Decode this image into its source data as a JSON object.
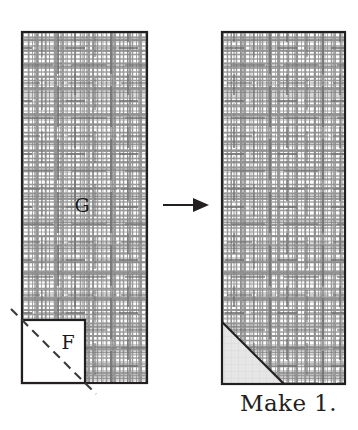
{
  "figure": {
    "type": "quilting-block-assembly-diagram",
    "caption": "Make 1.",
    "arrow": {
      "icon": "right-arrow-icon",
      "direction": "right"
    },
    "colors": {
      "outline": "#231f20",
      "fabric_print_line": "#8d8d8d",
      "fabric_print_line_dark": "#6e6e6e",
      "fabric_background": "#ffffff",
      "solid_patch_fill": "#e2e2e2",
      "text": "#231f20",
      "dashed_line": "#3a3a3a"
    },
    "before": {
      "name": "before-unit",
      "description": "Background rectangle G with square F placed on lower-left corner, marked with a diagonal sewing line",
      "pieces": [
        {
          "id": "G",
          "label": "G",
          "shape": "rectangle",
          "fabric": "printed",
          "label_x": 82,
          "label_y": 212,
          "x": 22,
          "y": 32,
          "width": 125,
          "height": 351
        },
        {
          "id": "F",
          "label": "F",
          "shape": "square",
          "fabric": "solid",
          "label_x": 68,
          "label_y": 349,
          "x": 22,
          "y": 320,
          "width": 63,
          "height": 63,
          "sewing_line": {
            "style": "dashed",
            "from_corner": "top-left",
            "to_corner": "bottom-right"
          }
        }
      ]
    },
    "after": {
      "name": "after-unit",
      "description": "Same rectangle after stitching and trimming, showing solid triangle in lower-left corner",
      "pieces": [
        {
          "id": "G",
          "shape": "rectangle",
          "fabric": "printed",
          "x": 222,
          "y": 32,
          "width": 123,
          "height": 352
        },
        {
          "id": "F",
          "shape": "triangle",
          "fabric": "solid",
          "apex_x": 222,
          "apex_y": 322,
          "base_x": 284,
          "base_y": 384
        }
      ]
    }
  }
}
